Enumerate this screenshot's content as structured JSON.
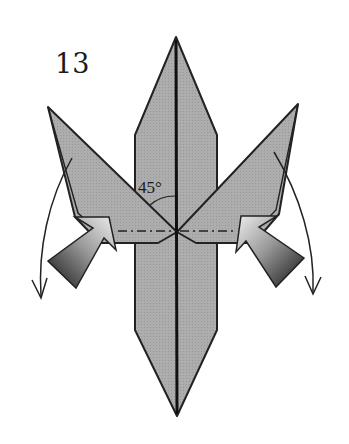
{
  "diagram": {
    "step_number": "13",
    "angle_label": "45°",
    "colors": {
      "paper": "#a9a9a9",
      "outline": "#222222",
      "background": "#ffffff",
      "arrow_dark": "#1e1e1e",
      "arrow_light": "#e6e6e6"
    },
    "elements": {
      "central_strip": "vertical paper strip with pointed top and bottom",
      "left_flap": "diagonal flap to upper left",
      "right_flap": "diagonal flap to upper right",
      "valley_fold_lines": "dash-dot horizontal fold lines",
      "push_arrows": "two gradient push arrows pointing inward",
      "rotate_arrows": "two curved arrows swinging flaps downward"
    }
  }
}
